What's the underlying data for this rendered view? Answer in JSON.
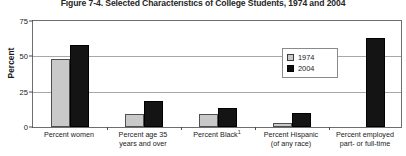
{
  "chart_data": {
    "type": "bar",
    "title": "Figure 7-4. Selected Characteristics of College Students, 1974 and 2004",
    "xlabel": "",
    "ylabel": "Percent",
    "ylim": [
      0,
      75
    ],
    "yticks": [
      0,
      25,
      50,
      75
    ],
    "ytick_labels": [
      "0",
      "25",
      "50",
      "75"
    ],
    "grid": true,
    "legend_position": "upper-center-right",
    "categories": [
      "Percent women",
      "Percent age 35 years and over",
      "Percent Black",
      "Percent Hispanic (of any race)",
      "Percent employed part- or full-time"
    ],
    "category_lines": [
      [
        "Percent women"
      ],
      [
        "Percent age 35",
        "years and over"
      ],
      [
        "Percent Black",
        "1"
      ],
      [
        "Percent Hispanic",
        "(of any race)"
      ],
      [
        "Percent employed",
        "part- or full-time"
      ]
    ],
    "series": [
      {
        "name": "1974",
        "color": "#c9c9c9",
        "values": [
          47,
          9,
          9,
          3,
          null
        ]
      },
      {
        "name": "2004",
        "color": "#141414",
        "values": [
          57,
          18,
          13,
          10,
          62
        ]
      }
    ],
    "footnote_marker": "1"
  },
  "legend": {
    "items": [
      {
        "label": "1974",
        "swatch": "light-gray-square"
      },
      {
        "label": "2004",
        "swatch": "black-square"
      }
    ]
  }
}
